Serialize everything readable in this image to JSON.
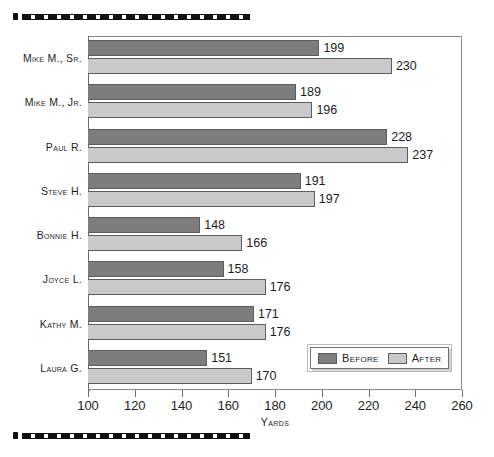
{
  "decor": {
    "top_rule": "dashed-rule",
    "bottom_rule": "dashed-rule"
  },
  "legend": {
    "before_label": "Before",
    "after_label": "After"
  },
  "colors": {
    "before": "#7d7d7d",
    "after": "#c9c9c9",
    "frame": "#8a8a8a",
    "text": "#1d1d1d"
  },
  "chart_data": {
    "type": "bar",
    "orientation": "horizontal",
    "title": "",
    "xlabel": "Yards",
    "ylabel": "",
    "xlim": [
      100,
      260
    ],
    "xticks": [
      100,
      120,
      140,
      160,
      180,
      200,
      220,
      240,
      260
    ],
    "grid": false,
    "legend_position": "inside-bottom-right",
    "categories": [
      "Mike M., Sr.",
      "Mike M., Jr.",
      "Paul R.",
      "Steve H.",
      "Bonnie H.",
      "Joyce L.",
      "Kathy M.",
      "Laura G."
    ],
    "series": [
      {
        "name": "Before",
        "color": "#7d7d7d",
        "values": [
          199,
          189,
          228,
          191,
          148,
          158,
          171,
          151
        ]
      },
      {
        "name": "After",
        "color": "#c9c9c9",
        "values": [
          230,
          196,
          237,
          197,
          166,
          176,
          176,
          170
        ]
      }
    ]
  }
}
